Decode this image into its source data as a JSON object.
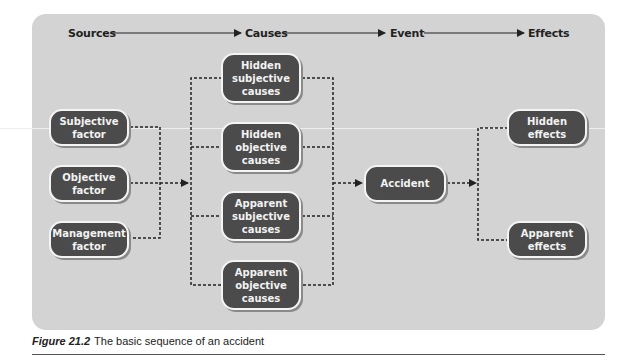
{
  "header": {
    "stages": [
      "Sources",
      "Causes",
      "Event",
      "Effects"
    ]
  },
  "nodes": {
    "sources": [
      {
        "label": "Subjective\nfactor"
      },
      {
        "label": "Objective\nfactor"
      },
      {
        "label": "Management\nfactor"
      }
    ],
    "causes": [
      {
        "label": "Hidden\nsubjective\ncauses"
      },
      {
        "label": "Hidden\nobjective\ncauses"
      },
      {
        "label": "Apparent\nsubjective\ncauses"
      },
      {
        "label": "Apparent\nobjective\ncauses"
      }
    ],
    "event": {
      "label": "Accident"
    },
    "effects": [
      {
        "label": "Hidden\neffects"
      },
      {
        "label": "Apparent\neffects"
      }
    ]
  },
  "caption": {
    "figure_label": "Figure 21.2",
    "text": "The basic sequence of an accident"
  },
  "colors": {
    "panel": "#d3d3d3",
    "node_fill": "#4b4b4b",
    "node_text": "#f2f2f2",
    "line": "#222222"
  }
}
